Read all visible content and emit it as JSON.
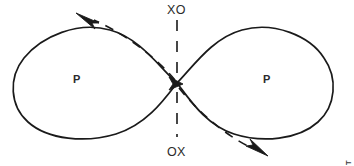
{
  "figure": {
    "type": "lemniscate-diagram",
    "width": 354,
    "height": 166,
    "background_color": "#ffffff",
    "stroke_color": "#1a1a1a",
    "text_color": "#2b2b2b"
  },
  "labels": {
    "top_axis": "XO",
    "bottom_axis": "OX",
    "left_loop": "P",
    "right_loop": "P"
  },
  "credit": {
    "text": "BRIDGET MCKNIGHT",
    "orientation": "vertical-right-edge"
  },
  "geometry": {
    "center": {
      "x": 177,
      "y": 83
    },
    "left_loop": {
      "x_min": 17,
      "x_max": 177,
      "y_min": 28,
      "y_max": 138
    },
    "right_loop": {
      "x_min": 177,
      "x_max": 331,
      "y_min": 28,
      "y_max": 138
    },
    "vertical_dash_top": {
      "x": 177,
      "y_start": 20,
      "y_end": 78
    },
    "vertical_dash_bottom": {
      "x": 177,
      "y_start": 90,
      "y_end": 136
    }
  },
  "arrows": [
    {
      "name": "upper-left-arrow",
      "x": 85,
      "y": 15,
      "direction": "up-left"
    },
    {
      "name": "center-arrow",
      "x": 177,
      "y": 83,
      "direction": "right"
    },
    {
      "name": "lower-right-arrow",
      "x": 259,
      "y": 152,
      "direction": "down-right"
    }
  ]
}
